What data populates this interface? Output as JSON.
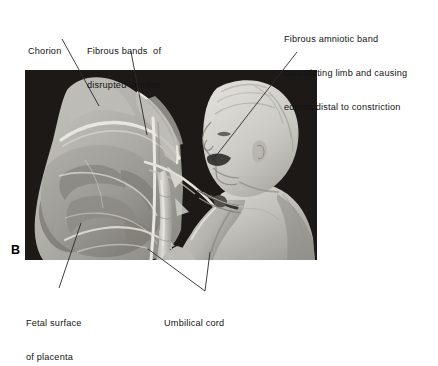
{
  "figure": {
    "panel_letter": "B",
    "type": "medical-illustration",
    "background_color": "#ffffff",
    "plate_background_color": "#231f1d",
    "leader_line_color": "#2a2a2a"
  },
  "labels": {
    "chorion": {
      "text": "Chorion",
      "lines": [
        "Chorion"
      ]
    },
    "fibrous_bands": {
      "text": "Fibrous bands  of\ndisrupted amnion",
      "lines": [
        "Fibrous bands  of",
        "disrupted amnion"
      ]
    },
    "fibrous_amniotic_band": {
      "text": "Fibrous amniotic band\nconstricting limb and causing\nedema distal to constriction",
      "lines": [
        "Fibrous amniotic band",
        "constricting limb and causing",
        "edema distal to constriction"
      ]
    },
    "fetal_surface": {
      "text": "Fetal surface\nof placenta",
      "lines": [
        "Fetal surface",
        "of placenta"
      ]
    },
    "umbilical_cord": {
      "text": "Umbilical cord",
      "lines": [
        "Umbilical cord"
      ]
    }
  }
}
